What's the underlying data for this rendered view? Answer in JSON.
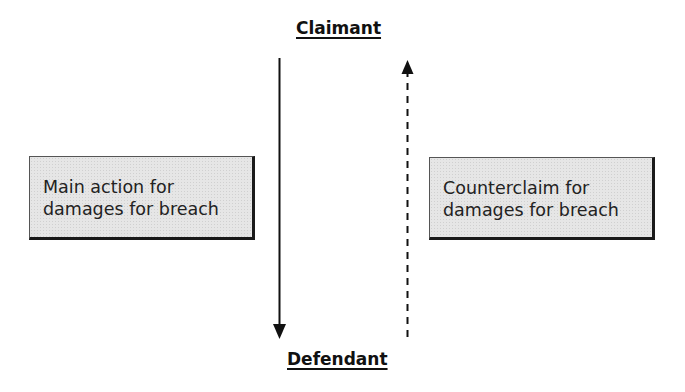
{
  "diagram": {
    "top_party": {
      "label": "Claimant"
    },
    "bottom_party": {
      "label": "Defendant"
    },
    "actions": [
      {
        "id": "main-action",
        "lines": [
          "Main action for",
          "damages for breach"
        ],
        "direction": "claimant-to-defendant",
        "arrow_style": "solid"
      },
      {
        "id": "counterclaim",
        "lines": [
          "Counterclaim for",
          "damages for breach"
        ],
        "direction": "defendant-to-claimant",
        "arrow_style": "dashed"
      }
    ],
    "colors": {
      "box_fill": "#e6e6e6",
      "box_border": "#1a1a1a",
      "arrow": "#111111",
      "text": "#222222"
    }
  }
}
